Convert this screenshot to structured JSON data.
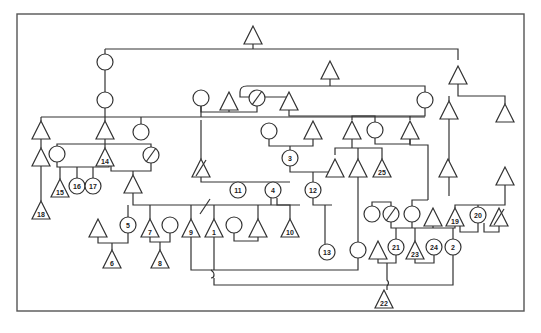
{
  "figure": {
    "type": "pedigree-diagram",
    "frame": {
      "x": 17,
      "y": 14,
      "w": 507,
      "h": 297,
      "color": "#555555"
    },
    "line_color": "#333333",
    "shape_legend": {
      "triangle": "node-triangle",
      "circle": "node-circle",
      "slash": "deceased-marker"
    }
  },
  "nodes": [
    {
      "id": "t_top",
      "shape": "triangle",
      "x": 253,
      "y": 35,
      "label": ""
    },
    {
      "id": "c_a",
      "shape": "circle",
      "x": 105,
      "y": 62,
      "label": ""
    },
    {
      "id": "t_b",
      "shape": "triangle",
      "x": 330,
      "y": 70,
      "label": ""
    },
    {
      "id": "t_c",
      "shape": "triangle",
      "x": 458,
      "y": 75,
      "label": ""
    },
    {
      "id": "c_d",
      "shape": "circle",
      "x": 105,
      "y": 100,
      "label": ""
    },
    {
      "id": "c_e",
      "shape": "circle",
      "x": 201,
      "y": 98,
      "label": ""
    },
    {
      "id": "t_f",
      "shape": "triangle",
      "x": 229,
      "y": 101,
      "label": ""
    },
    {
      "id": "c_g",
      "shape": "circle",
      "x": 257,
      "y": 98,
      "label": "",
      "deceased": true
    },
    {
      "id": "t_h",
      "shape": "triangle",
      "x": 289,
      "y": 101,
      "label": ""
    },
    {
      "id": "c_i",
      "shape": "circle",
      "x": 425,
      "y": 100,
      "label": ""
    },
    {
      "id": "t_j",
      "shape": "triangle",
      "x": 449,
      "y": 110,
      "label": ""
    },
    {
      "id": "t_k",
      "shape": "triangle",
      "x": 505,
      "y": 113,
      "label": ""
    },
    {
      "id": "t_l",
      "shape": "triangle",
      "x": 41,
      "y": 130,
      "label": ""
    },
    {
      "id": "t_m",
      "shape": "triangle",
      "x": 105,
      "y": 130,
      "label": ""
    },
    {
      "id": "c_n",
      "shape": "circle",
      "x": 141,
      "y": 132,
      "label": ""
    },
    {
      "id": "c_o",
      "shape": "circle",
      "x": 269,
      "y": 131,
      "label": ""
    },
    {
      "id": "t_p",
      "shape": "triangle",
      "x": 313,
      "y": 130,
      "label": ""
    },
    {
      "id": "t_q",
      "shape": "triangle",
      "x": 352,
      "y": 130,
      "label": ""
    },
    {
      "id": "c_r",
      "shape": "circle",
      "x": 375,
      "y": 130,
      "label": ""
    },
    {
      "id": "t_s",
      "shape": "triangle",
      "x": 410,
      "y": 130,
      "label": ""
    },
    {
      "id": "t_u",
      "shape": "triangle",
      "x": 41,
      "y": 157,
      "label": ""
    },
    {
      "id": "c_v",
      "shape": "circle",
      "x": 57,
      "y": 154,
      "label": ""
    },
    {
      "id": "n14",
      "shape": "triangle",
      "x": 105,
      "y": 157,
      "label": "14"
    },
    {
      "id": "c_w",
      "shape": "circle",
      "x": 151,
      "y": 155,
      "label": "",
      "deceased": true
    },
    {
      "id": "t_x",
      "shape": "triangle",
      "x": 201,
      "y": 168,
      "label": "",
      "deceased": true
    },
    {
      "id": "n3",
      "shape": "circle",
      "x": 290,
      "y": 158,
      "label": "3"
    },
    {
      "id": "t_y",
      "shape": "triangle",
      "x": 335,
      "y": 168,
      "label": ""
    },
    {
      "id": "t_z",
      "shape": "triangle",
      "x": 358,
      "y": 168,
      "label": ""
    },
    {
      "id": "n25",
      "shape": "triangle",
      "x": 382,
      "y": 168,
      "label": "25"
    },
    {
      "id": "t_aa",
      "shape": "triangle",
      "x": 448,
      "y": 168,
      "label": ""
    },
    {
      "id": "t_ab",
      "shape": "triangle",
      "x": 505,
      "y": 176,
      "label": ""
    },
    {
      "id": "n15",
      "shape": "triangle",
      "x": 60,
      "y": 188,
      "label": "15"
    },
    {
      "id": "n16",
      "shape": "circle",
      "x": 77,
      "y": 186,
      "label": "16"
    },
    {
      "id": "n17",
      "shape": "circle",
      "x": 93,
      "y": 186,
      "label": "17"
    },
    {
      "id": "t_ac",
      "shape": "triangle",
      "x": 133,
      "y": 184,
      "label": ""
    },
    {
      "id": "n11",
      "shape": "circle",
      "x": 238,
      "y": 190,
      "label": "11"
    },
    {
      "id": "n4",
      "shape": "circle",
      "x": 273,
      "y": 190,
      "label": "4"
    },
    {
      "id": "n12",
      "shape": "circle",
      "x": 313,
      "y": 190,
      "label": "12"
    },
    {
      "id": "n18",
      "shape": "triangle",
      "x": 41,
      "y": 210,
      "label": "18"
    },
    {
      "id": "c_ad",
      "shape": "circle",
      "x": 372,
      "y": 214,
      "label": ""
    },
    {
      "id": "c_ae",
      "shape": "circle",
      "x": 391,
      "y": 214,
      "label": "",
      "deceased": true
    },
    {
      "id": "c_af",
      "shape": "circle",
      "x": 412,
      "y": 214,
      "label": ""
    },
    {
      "id": "t_ag",
      "shape": "triangle",
      "x": 433,
      "y": 217,
      "label": ""
    },
    {
      "id": "n19",
      "shape": "triangle",
      "x": 455,
      "y": 217,
      "label": "19"
    },
    {
      "id": "n20",
      "shape": "circle",
      "x": 478,
      "y": 215,
      "label": "20"
    },
    {
      "id": "t_ah",
      "shape": "triangle",
      "x": 499,
      "y": 217,
      "label": "",
      "deceased": true
    },
    {
      "id": "t_ai",
      "shape": "triangle",
      "x": 98,
      "y": 228,
      "label": ""
    },
    {
      "id": "n5",
      "shape": "circle",
      "x": 128,
      "y": 225,
      "label": "5"
    },
    {
      "id": "n7",
      "shape": "triangle",
      "x": 150,
      "y": 228,
      "label": "7"
    },
    {
      "id": "c_aj",
      "shape": "circle",
      "x": 170,
      "y": 225,
      "label": ""
    },
    {
      "id": "n9",
      "shape": "triangle",
      "x": 191,
      "y": 228,
      "label": "9"
    },
    {
      "id": "n1",
      "shape": "triangle",
      "x": 214,
      "y": 228,
      "label": "1"
    },
    {
      "id": "c_ak",
      "shape": "circle",
      "x": 234,
      "y": 225,
      "label": ""
    },
    {
      "id": "t_al",
      "shape": "triangle",
      "x": 258,
      "y": 228,
      "label": ""
    },
    {
      "id": "n10",
      "shape": "triangle",
      "x": 290,
      "y": 228,
      "label": "10"
    },
    {
      "id": "c_am",
      "shape": "circle",
      "x": 358,
      "y": 250,
      "label": ""
    },
    {
      "id": "t_an",
      "shape": "triangle",
      "x": 378,
      "y": 250,
      "label": ""
    },
    {
      "id": "n21",
      "shape": "circle",
      "x": 396,
      "y": 247,
      "label": "21"
    },
    {
      "id": "n23",
      "shape": "triangle",
      "x": 415,
      "y": 250,
      "label": "23"
    },
    {
      "id": "n24",
      "shape": "circle",
      "x": 434,
      "y": 247,
      "label": "24"
    },
    {
      "id": "n2",
      "shape": "circle",
      "x": 453,
      "y": 247,
      "label": "2"
    },
    {
      "id": "n6",
      "shape": "triangle",
      "x": 112,
      "y": 259,
      "label": "6"
    },
    {
      "id": "n8",
      "shape": "triangle",
      "x": 160,
      "y": 259,
      "label": "8"
    },
    {
      "id": "n13",
      "shape": "circle",
      "x": 327,
      "y": 252,
      "label": "13"
    },
    {
      "id": "n22",
      "shape": "triangle",
      "x": 384,
      "y": 299,
      "label": "22"
    }
  ],
  "edges": [
    "M105,49 H458 V60",
    "M105,49 V54",
    "M253,44 V49",
    "M105,70 V92",
    "M105,108 V114 M105,114 V121",
    "M41,117 H425",
    "M41,117 V121",
    "M141,117 V124",
    "M201,117 V106",
    "M201,106 V112 H229 M229,110 V112 H257 V106",
    "M330,79 V86 M247,86 H425 V92",
    "M247,86 Q240,86 240,92 V97 H289 V101",
    "M289,110 V116 H425 V108",
    "M458,84 V96 H505 V104 M449,96 V101",
    "M41,139 V148",
    "M41,166 V201",
    "M57,146 V144 H151 V147",
    "M105,139 V148",
    "M57,162 V167 H109 V166 M60,167 V179 M77,167 V178 M93,167 V178",
    "M111,166 V171 H151 V163 M133,171 V175",
    "M201,120 V159",
    "M201,177 V182 H290",
    "M269,139 V146 H313 V139",
    "M290,146 V150",
    "M290,166 V172 H335 V177",
    "M352,139 V148 M352,120 V116 H375 V122",
    "M335,155 V148 H382 V159 M358,148 V159",
    "M375,138 V144 H410 V139",
    "M410,120 V116",
    "M410,139 V145 H428 V200",
    "M238,182 V186",
    "M273,182 V186",
    "M313,172 V182",
    "M133,193 V205 H300",
    "M128,205 V217",
    "M150,205 V219",
    "M191,205 V219",
    "M214,205 V219",
    "M258,205 V219",
    "M271,198 V205 M277,198 V205 H290 V219",
    "M313,198 V205 H332",
    "M325,205 V244",
    "M98,237 V243 H128 V233",
    "M112,243 V250",
    "M150,237 V242 H170 V233",
    "M160,242 V250",
    "M234,233 V241 H258 V237",
    "M191,237 V270 H211 Q214,272 214,275 Q214,278 211,278",
    "M214,237 V270 M214,278 V285 H453 V255",
    "M211,270 H358 V258",
    "M358,177 V242",
    "M372,206 V202 H391 V206",
    "M391,222 V228 H455 V226",
    "M412,206 V200 H428",
    "M412,222 V228 M433,226 V228",
    "M396,228 V239",
    "M415,228 V241",
    "M453,228 V239",
    "M455,208 V205 H505 V185",
    "M460,226 V232 H478 V223",
    "M484,223 V232 H499 V226",
    "M478,207 V205",
    "M378,259 V263 H396 V255",
    "M387,263 V280 Q390,283 387,286 V290",
    "M415,259 V263 H434 V255",
    "M449,119 V196"
  ],
  "slashes": [
    "M196,176 L206,160",
    "M200,214 L210,199",
    "M146,162 L156,148",
    "M252,105 L262,91",
    "M386,221 L396,207",
    "M494,225 L504,209"
  ]
}
